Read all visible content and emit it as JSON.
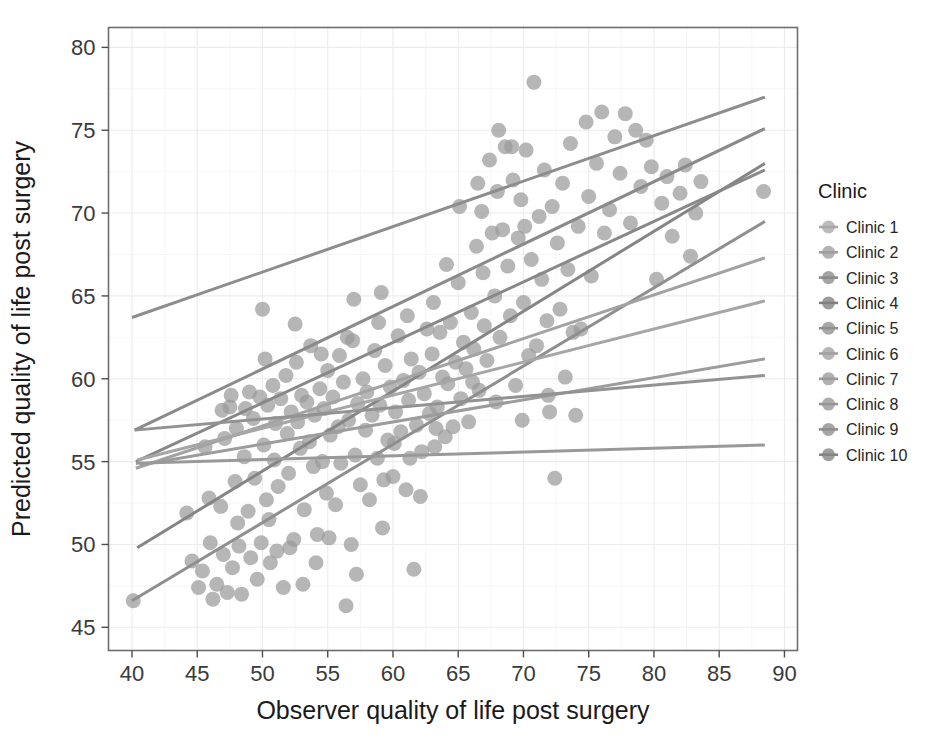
{
  "chart_data": {
    "type": "scatter",
    "title": "",
    "xlabel": "Observer quality of life post surgery",
    "ylabel": "Predicted quality of life post surgery",
    "xlim": [
      38.2,
      91.0
    ],
    "ylim": [
      43.6,
      81.2
    ],
    "xticks": [
      40,
      45,
      50,
      55,
      60,
      65,
      70,
      75,
      80,
      85,
      90
    ],
    "yticks": [
      45,
      50,
      55,
      60,
      65,
      70,
      75,
      80
    ],
    "xtick_labels": [
      "40",
      "45",
      "50",
      "55",
      "60",
      "65",
      "70",
      "75",
      "80",
      "85",
      "90"
    ],
    "ytick_labels": [
      "45",
      "50",
      "55",
      "60",
      "65",
      "70",
      "75",
      "80"
    ],
    "grid": true,
    "grid_color": "#ececec",
    "panel_background": "#ffffff",
    "panel_border_color": "#6e6e6e",
    "point_color": "#9a9a9a",
    "point_opacity": 0.72,
    "point_radius": 7.5,
    "legend": {
      "title": "Clinic",
      "position": "right",
      "entries": [
        {
          "label": "Clinic 1",
          "color": "#a8a8a8"
        },
        {
          "label": "Clinic 2",
          "color": "#9e9e9e"
        },
        {
          "label": "Clinic 3",
          "color": "#8a8a8a"
        },
        {
          "label": "Clinic 4",
          "color": "#808080"
        },
        {
          "label": "Clinic 5",
          "color": "#8f8f8f"
        },
        {
          "label": "Clinic 6",
          "color": "#a0a0a0"
        },
        {
          "label": "Clinic 7",
          "color": "#9b9b9b"
        },
        {
          "label": "Clinic 8",
          "color": "#969696"
        },
        {
          "label": "Clinic 9",
          "color": "#8d8d8d"
        },
        {
          "label": "Clinic 10",
          "color": "#848484"
        }
      ]
    },
    "series": [
      {
        "name": "Clinic 1",
        "color": "#8d8d8d",
        "fit_line": {
          "x0": 40.0,
          "y0": 63.7,
          "x1": 88.5,
          "y1": 77.0,
          "width": 3.0
        }
      },
      {
        "name": "Clinic 2",
        "color": "#8a8a8a",
        "fit_line": {
          "x0": 40.2,
          "y0": 56.9,
          "x1": 88.5,
          "y1": 75.1,
          "width": 3.0
        }
      },
      {
        "name": "Clinic 3",
        "color": "#858585",
        "fit_line": {
          "x0": 40.4,
          "y0": 49.8,
          "x1": 88.5,
          "y1": 73.0,
          "width": 3.0
        }
      },
      {
        "name": "Clinic 4",
        "color": "#888888",
        "fit_line": {
          "x0": 40.3,
          "y0": 55.0,
          "x1": 88.5,
          "y1": 72.6,
          "width": 3.0
        }
      },
      {
        "name": "Clinic 5",
        "color": "#8f8f8f",
        "fit_line": {
          "x0": 40.0,
          "y0": 46.6,
          "x1": 88.5,
          "y1": 69.5,
          "width": 3.0
        }
      },
      {
        "name": "Clinic 6",
        "color": "#a2a2a2",
        "fit_line": {
          "x0": 40.3,
          "y0": 54.6,
          "x1": 88.5,
          "y1": 67.3,
          "width": 3.0
        }
      },
      {
        "name": "Clinic 7",
        "color": "#a6a6a6",
        "fit_line": {
          "x0": 40.4,
          "y0": 55.1,
          "x1": 88.5,
          "y1": 64.7,
          "width": 3.0
        }
      },
      {
        "name": "Clinic 8",
        "color": "#9c9c9c",
        "fit_line": {
          "x0": 40.6,
          "y0": 54.8,
          "x1": 88.5,
          "y1": 61.2,
          "width": 3.0
        }
      },
      {
        "name": "Clinic 9",
        "color": "#929292",
        "fit_line": {
          "x0": 40.2,
          "y0": 56.9,
          "x1": 88.5,
          "y1": 60.2,
          "width": 3.0
        }
      },
      {
        "name": "Clinic 10",
        "color": "#999999",
        "fit_line": {
          "x0": 40.3,
          "y0": 54.9,
          "x1": 88.5,
          "y1": 56.0,
          "width": 3.0
        }
      }
    ],
    "points": [
      [
        40.1,
        46.6
      ],
      [
        44.2,
        51.9
      ],
      [
        44.6,
        49.0
      ],
      [
        45.1,
        47.4
      ],
      [
        45.4,
        48.4
      ],
      [
        45.6,
        55.9
      ],
      [
        46.0,
        50.1
      ],
      [
        46.2,
        46.7
      ],
      [
        46.5,
        47.6
      ],
      [
        46.8,
        52.3
      ],
      [
        46.9,
        58.1
      ],
      [
        47.0,
        49.4
      ],
      [
        47.1,
        56.4
      ],
      [
        47.3,
        47.1
      ],
      [
        47.5,
        58.3
      ],
      [
        47.7,
        48.6
      ],
      [
        47.9,
        53.8
      ],
      [
        48.0,
        57.0
      ],
      [
        48.2,
        49.9
      ],
      [
        48.4,
        47.0
      ],
      [
        48.6,
        55.3
      ],
      [
        48.7,
        58.2
      ],
      [
        48.9,
        52.0
      ],
      [
        49.1,
        49.2
      ],
      [
        49.3,
        57.6
      ],
      [
        49.4,
        54.0
      ],
      [
        49.6,
        47.9
      ],
      [
        49.8,
        58.9
      ],
      [
        49.9,
        50.1
      ],
      [
        50.0,
        64.2
      ],
      [
        50.1,
        56.0
      ],
      [
        50.3,
        52.7
      ],
      [
        50.4,
        58.4
      ],
      [
        50.6,
        48.9
      ],
      [
        50.8,
        59.6
      ],
      [
        50.9,
        55.1
      ],
      [
        51.0,
        57.3
      ],
      [
        51.2,
        53.5
      ],
      [
        51.4,
        58.8
      ],
      [
        51.6,
        47.4
      ],
      [
        51.8,
        60.2
      ],
      [
        51.9,
        56.7
      ],
      [
        52.0,
        54.3
      ],
      [
        52.2,
        58.0
      ],
      [
        52.4,
        50.3
      ],
      [
        52.6,
        61.0
      ],
      [
        52.7,
        57.4
      ],
      [
        52.9,
        55.8
      ],
      [
        53.0,
        59.0
      ],
      [
        53.2,
        52.1
      ],
      [
        53.4,
        58.6
      ],
      [
        53.6,
        56.2
      ],
      [
        53.7,
        62.0
      ],
      [
        53.9,
        54.7
      ],
      [
        54.0,
        57.8
      ],
      [
        54.2,
        50.6
      ],
      [
        54.4,
        59.4
      ],
      [
        54.6,
        55.0
      ],
      [
        54.7,
        58.2
      ],
      [
        54.9,
        53.1
      ],
      [
        55.0,
        60.5
      ],
      [
        55.2,
        56.6
      ],
      [
        55.4,
        58.9
      ],
      [
        55.6,
        52.4
      ],
      [
        55.8,
        57.1
      ],
      [
        55.9,
        61.4
      ],
      [
        56.0,
        54.9
      ],
      [
        56.2,
        59.8
      ],
      [
        56.4,
        46.3
      ],
      [
        56.6,
        57.5
      ],
      [
        56.8,
        50.0
      ],
      [
        56.9,
        62.3
      ],
      [
        57.1,
        55.4
      ],
      [
        57.3,
        58.5
      ],
      [
        57.5,
        53.6
      ],
      [
        57.7,
        60.0
      ],
      [
        57.9,
        56.9
      ],
      [
        58.0,
        59.2
      ],
      [
        58.2,
        52.7
      ],
      [
        58.4,
        57.8
      ],
      [
        58.6,
        61.7
      ],
      [
        58.8,
        55.2
      ],
      [
        59.0,
        58.4
      ],
      [
        59.2,
        51.0
      ],
      [
        59.4,
        60.8
      ],
      [
        59.6,
        56.3
      ],
      [
        59.8,
        59.5
      ],
      [
        60.0,
        54.1
      ],
      [
        60.2,
        58.0
      ],
      [
        60.4,
        62.6
      ],
      [
        60.6,
        56.8
      ],
      [
        60.8,
        59.9
      ],
      [
        61.0,
        53.3
      ],
      [
        61.2,
        58.7
      ],
      [
        61.4,
        61.2
      ],
      [
        61.6,
        48.5
      ],
      [
        61.8,
        57.2
      ],
      [
        62.0,
        60.4
      ],
      [
        62.2,
        55.6
      ],
      [
        62.4,
        59.1
      ],
      [
        62.6,
        63.0
      ],
      [
        62.8,
        57.9
      ],
      [
        63.0,
        61.5
      ],
      [
        63.2,
        55.9
      ],
      [
        63.4,
        58.3
      ],
      [
        63.6,
        62.8
      ],
      [
        63.8,
        60.1
      ],
      [
        64.0,
        56.5
      ],
      [
        64.2,
        59.7
      ],
      [
        64.4,
        63.4
      ],
      [
        64.6,
        57.1
      ],
      [
        64.8,
        61.0
      ],
      [
        65.0,
        65.8
      ],
      [
        65.2,
        58.8
      ],
      [
        65.4,
        62.2
      ],
      [
        65.6,
        60.6
      ],
      [
        65.8,
        57.4
      ],
      [
        66.0,
        64.0
      ],
      [
        66.2,
        61.8
      ],
      [
        66.4,
        68.0
      ],
      [
        66.6,
        59.3
      ],
      [
        66.8,
        70.1
      ],
      [
        66.9,
        66.4
      ],
      [
        67.0,
        63.2
      ],
      [
        67.2,
        61.1
      ],
      [
        67.4,
        73.2
      ],
      [
        67.6,
        68.8
      ],
      [
        67.8,
        65.0
      ],
      [
        68.0,
        71.3
      ],
      [
        68.2,
        62.5
      ],
      [
        68.4,
        69.0
      ],
      [
        68.6,
        74.0
      ],
      [
        68.8,
        66.8
      ],
      [
        69.0,
        63.8
      ],
      [
        69.2,
        72.0
      ],
      [
        69.4,
        59.6
      ],
      [
        69.6,
        68.5
      ],
      [
        69.8,
        70.8
      ],
      [
        70.0,
        64.6
      ],
      [
        70.2,
        73.8
      ],
      [
        70.4,
        61.4
      ],
      [
        70.6,
        67.2
      ],
      [
        70.8,
        77.9
      ],
      [
        71.0,
        62.0
      ],
      [
        71.2,
        69.8
      ],
      [
        71.4,
        66.0
      ],
      [
        71.6,
        72.6
      ],
      [
        71.8,
        63.5
      ],
      [
        72.0,
        58.0
      ],
      [
        72.2,
        70.4
      ],
      [
        72.4,
        54.0
      ],
      [
        72.6,
        68.2
      ],
      [
        72.8,
        64.2
      ],
      [
        73.0,
        71.8
      ],
      [
        73.2,
        60.1
      ],
      [
        73.4,
        66.6
      ],
      [
        73.6,
        74.2
      ],
      [
        73.8,
        62.8
      ],
      [
        74.0,
        57.8
      ],
      [
        74.2,
        69.2
      ],
      [
        74.4,
        63.0
      ],
      [
        74.8,
        75.5
      ],
      [
        75.0,
        71.0
      ],
      [
        75.2,
        66.2
      ],
      [
        75.6,
        73.0
      ],
      [
        76.0,
        76.1
      ],
      [
        76.2,
        68.8
      ],
      [
        76.6,
        70.2
      ],
      [
        77.0,
        74.6
      ],
      [
        77.4,
        72.4
      ],
      [
        77.8,
        76.0
      ],
      [
        78.2,
        69.4
      ],
      [
        78.6,
        75.0
      ],
      [
        79.0,
        71.6
      ],
      [
        79.4,
        74.4
      ],
      [
        79.8,
        72.8
      ],
      [
        80.2,
        66.0
      ],
      [
        80.6,
        70.6
      ],
      [
        81.0,
        72.2
      ],
      [
        81.4,
        68.6
      ],
      [
        82.0,
        71.2
      ],
      [
        82.4,
        72.9
      ],
      [
        82.8,
        67.4
      ],
      [
        83.2,
        70.0
      ],
      [
        83.6,
        71.9
      ],
      [
        88.4,
        71.3
      ],
      [
        50.2,
        61.2
      ],
      [
        51.1,
        49.6
      ],
      [
        53.1,
        47.6
      ],
      [
        54.5,
        61.5
      ],
      [
        57.0,
        64.8
      ],
      [
        58.9,
        63.4
      ],
      [
        60.1,
        56.1
      ],
      [
        62.1,
        52.9
      ],
      [
        64.1,
        66.9
      ],
      [
        66.1,
        59.8
      ],
      [
        67.9,
        58.6
      ],
      [
        69.9,
        57.5
      ],
      [
        71.9,
        59.0
      ],
      [
        49.0,
        59.2
      ],
      [
        47.6,
        59.0
      ],
      [
        52.5,
        63.3
      ],
      [
        56.5,
        62.5
      ],
      [
        59.1,
        65.2
      ],
      [
        61.1,
        63.8
      ],
      [
        63.1,
        64.6
      ],
      [
        65.1,
        70.4
      ],
      [
        66.5,
        71.8
      ],
      [
        68.1,
        75.0
      ],
      [
        69.1,
        74.0
      ],
      [
        70.1,
        69.2
      ],
      [
        45.9,
        52.8
      ],
      [
        48.1,
        51.3
      ],
      [
        50.5,
        51.5
      ],
      [
        52.1,
        49.8
      ],
      [
        54.1,
        48.9
      ],
      [
        55.1,
        50.4
      ],
      [
        57.2,
        48.2
      ],
      [
        59.3,
        53.9
      ],
      [
        61.3,
        55.2
      ],
      [
        63.3,
        57.0
      ]
    ]
  }
}
